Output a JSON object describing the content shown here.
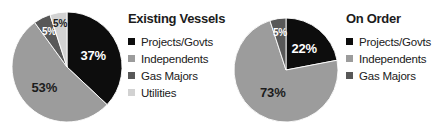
{
  "figure": {
    "background": "#ffffff",
    "width": 444,
    "height": 132
  },
  "palette": {
    "projects_govts": "#0d0d0d",
    "independents": "#9c9c9c",
    "gas_majors": "#585858",
    "utilities": "#d2d2d2",
    "label_light": "#ffffff",
    "label_dark": "#1c1c1c",
    "text": "#1c1c1c"
  },
  "charts": [
    {
      "id": "existing-vessels",
      "title": "Existing Vessels",
      "center": {
        "x": 67,
        "y": 67
      },
      "radius": 55,
      "legend": [
        {
          "label": "Projects/Govts",
          "color": "#0d0d0d"
        },
        {
          "label": "Independents",
          "color": "#9c9c9c"
        },
        {
          "label": "Gas Majors",
          "color": "#585858"
        },
        {
          "label": "Utilities",
          "color": "#d2d2d2"
        }
      ],
      "slices": [
        {
          "name": "Projects/Govts",
          "value": 37,
          "label": "37%",
          "color": "#0d0d0d",
          "label_color": "#ffffff",
          "label_r": 0.52,
          "label_size": 13
        },
        {
          "name": "Independents",
          "value": 53,
          "label": "53%",
          "color": "#9c9c9c",
          "label_color": "#1c1c1c",
          "label_r": 0.55,
          "label_size": 13
        },
        {
          "name": "Gas Majors",
          "value": 5,
          "label": "5%",
          "color": "#585858",
          "label_color": "#ffffff",
          "label_r": 0.72,
          "label_size": 10
        },
        {
          "name": "Utilities",
          "value": 5,
          "label": "5%",
          "color": "#d2d2d2",
          "label_color": "#1c1c1c",
          "label_r": 0.8,
          "label_size": 10
        }
      ]
    },
    {
      "id": "on-order",
      "title": "On Order",
      "center": {
        "x": 64,
        "y": 70
      },
      "radius": 52,
      "legend": [
        {
          "label": "Projects/Govts",
          "color": "#0d0d0d"
        },
        {
          "label": "Independents",
          "color": "#9c9c9c"
        },
        {
          "label": "Gas Majors",
          "color": "#585858"
        }
      ],
      "slices": [
        {
          "name": "Projects/Govts",
          "value": 22,
          "label": "22%",
          "color": "#0d0d0d",
          "label_color": "#ffffff",
          "label_r": 0.55,
          "label_size": 13
        },
        {
          "name": "Independents",
          "value": 73,
          "label": "73%",
          "color": "#9c9c9c",
          "label_color": "#1c1c1c",
          "label_r": 0.5,
          "label_size": 13
        },
        {
          "name": "Gas Majors",
          "value": 5,
          "label": "5%",
          "color": "#585858",
          "label_color": "#ffffff",
          "label_r": 0.74,
          "label_size": 10
        }
      ]
    }
  ],
  "chart_data": [
    {
      "type": "pie",
      "title": "Existing Vessels",
      "categories": [
        "Projects/Govts",
        "Independents",
        "Gas Majors",
        "Utilities"
      ],
      "values": [
        37,
        53,
        5,
        5
      ],
      "labels": [
        "37%",
        "53%",
        "5%",
        "5%"
      ],
      "units": "percent",
      "total": 100,
      "start_angle_deg": 0,
      "direction": "clockwise",
      "legend_position": "right",
      "colors": [
        "#0d0d0d",
        "#9c9c9c",
        "#585858",
        "#d2d2d2"
      ]
    },
    {
      "type": "pie",
      "title": "On Order",
      "categories": [
        "Projects/Govts",
        "Independents",
        "Gas Majors"
      ],
      "values": [
        22,
        73,
        5
      ],
      "labels": [
        "22%",
        "73%",
        "5%"
      ],
      "units": "percent",
      "total": 100,
      "start_angle_deg": 0,
      "direction": "clockwise",
      "legend_position": "right",
      "colors": [
        "#0d0d0d",
        "#9c9c9c",
        "#585858"
      ]
    }
  ]
}
